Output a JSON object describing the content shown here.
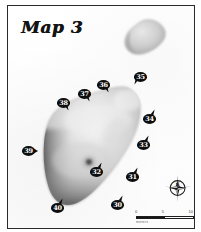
{
  "figure": {
    "title": "Map 3",
    "frame_color": "#2a2a2a",
    "background_color": "#ffffff"
  },
  "landforms": [
    {
      "name": "main-landmass",
      "description": "large pear-shaped landform occupying the centre-left of the map, light grey interior with dark shaded western and southern margins"
    },
    {
      "name": "small-island",
      "description": "small rounded grey landform in the upper right of the map"
    }
  ],
  "markers": [
    {
      "label": "30",
      "x": 103,
      "y": 194,
      "tail": "tail-tr"
    },
    {
      "label": "31",
      "x": 118,
      "y": 166,
      "tail": "tail-tr"
    },
    {
      "label": "32",
      "x": 82,
      "y": 161,
      "tail": "tail-tr"
    },
    {
      "label": "33",
      "x": 129,
      "y": 134,
      "tail": "tail-tr"
    },
    {
      "label": "34",
      "x": 135,
      "y": 108,
      "tail": "tail-tr"
    },
    {
      "label": "35",
      "x": 126,
      "y": 66,
      "tail": "tail-bl"
    },
    {
      "label": "36",
      "x": 89,
      "y": 74,
      "tail": "tail-br"
    },
    {
      "label": "37",
      "x": 70,
      "y": 83,
      "tail": "tail-br"
    },
    {
      "label": "38",
      "x": 49,
      "y": 92,
      "tail": "tail-br"
    },
    {
      "label": "39",
      "x": 14,
      "y": 140,
      "tail": "tail-r"
    },
    {
      "label": "40",
      "x": 43,
      "y": 197,
      "tail": "tail-tr"
    }
  ],
  "compass": {
    "name": "compass-rose",
    "north_label": "N"
  },
  "scale_bar": {
    "ticks": [
      "0",
      "5",
      "10"
    ],
    "units": "meters"
  }
}
